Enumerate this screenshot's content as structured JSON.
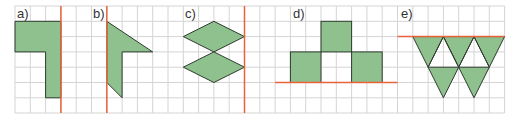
{
  "grid": {
    "x0": 15,
    "y0": 6,
    "cell": 15.3,
    "cols": 32,
    "rows": 7,
    "line_color": "#d4d4d4"
  },
  "colors": {
    "fill": "#8fc18f",
    "stroke": "#2e3b2e",
    "axis": "#e8633a"
  },
  "panels": [
    {
      "label": "a)"
    },
    {
      "label": "b)"
    },
    {
      "label": "c)"
    },
    {
      "label": "d)"
    },
    {
      "label": "e)"
    }
  ]
}
